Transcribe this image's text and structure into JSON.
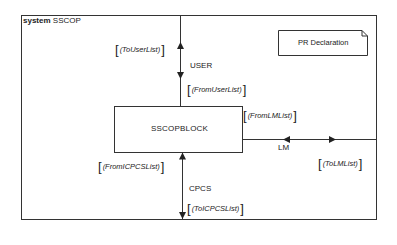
{
  "system": {
    "keyword": "system",
    "name": "SSCOP"
  },
  "block": {
    "name": "SSCOPBLOCK"
  },
  "declaration": {
    "label": "PR Declaration"
  },
  "channels": [
    {
      "name": "USER",
      "signal_lists": {
        "out": "(ToUserList)",
        "in": "(FromUserList)"
      }
    },
    {
      "name": "LM",
      "signal_lists": {
        "in": "(FromLMList)",
        "out": "(ToLMList)"
      }
    },
    {
      "name": "CPCS",
      "signal_lists": {
        "in": "(FromICPCSList)",
        "out": "(ToICPCSList)"
      }
    }
  ],
  "colors": {
    "line": "#333333",
    "background": "#ffffff"
  }
}
